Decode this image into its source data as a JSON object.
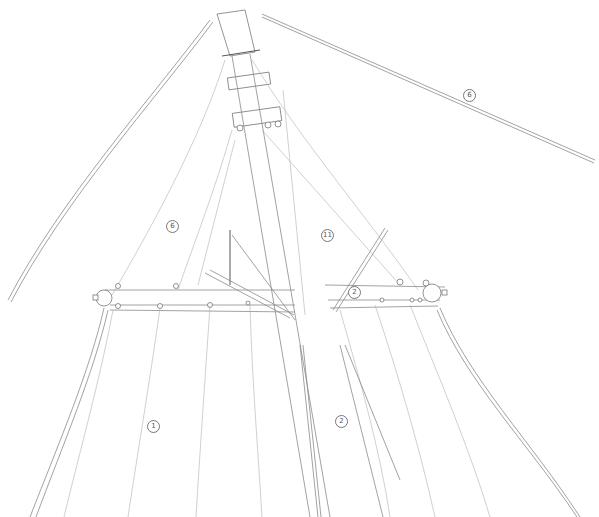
{
  "diagram": {
    "callouts": [
      {
        "id": "c6-top",
        "label": "6",
        "x": 468,
        "y": 94
      },
      {
        "id": "c6-left",
        "label": "6",
        "x": 171,
        "y": 225
      },
      {
        "id": "c11",
        "label": "11",
        "x": 326,
        "y": 234
      },
      {
        "id": "c2-spreader",
        "label": "2",
        "x": 353,
        "y": 291
      },
      {
        "id": "c1",
        "label": "1",
        "x": 152,
        "y": 425
      },
      {
        "id": "c2-sail",
        "label": "2",
        "x": 340,
        "y": 420
      }
    ],
    "colors": {
      "line": "#8a8a8a",
      "background": "#ffffff"
    }
  }
}
